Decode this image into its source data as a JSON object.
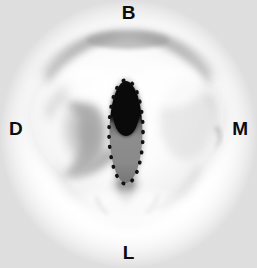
{
  "figure": {
    "kind": "anatomical-specimen-photograph",
    "background_color": "#ffffff"
  },
  "orientation_labels": [
    {
      "id": "buccal",
      "label": "B",
      "position": "top",
      "meaning": "Buccal"
    },
    {
      "id": "distal",
      "label": "D",
      "position": "left",
      "meaning": "Distal"
    },
    {
      "id": "mesial",
      "label": "M",
      "position": "right",
      "meaning": "Mesial"
    },
    {
      "id": "lingual",
      "label": "L",
      "position": "bottom",
      "meaning": "Lingual"
    }
  ],
  "annotation": {
    "type": "dotted-ellipse-outline",
    "shape": "vertical-ellipse",
    "outline_style": "dotted",
    "outline_color": "#111111",
    "core_color": "#0a0a0a",
    "fill_color": "#8f8f8f",
    "center_x": 126,
    "center_y": 132,
    "radius_x": 17,
    "radius_y": 52
  },
  "colors": {
    "background": "#ffffff",
    "label_text": "#0d0d0d",
    "specimen_light": "#fbfbfb",
    "specimen_mid": "#dcdcdc",
    "specimen_shadow": "#9d9d9d",
    "specimen_deep_shadow": "#6f6f6f",
    "annotation_core": "#0a0a0a",
    "annotation_fill": "#8f8f8f"
  }
}
